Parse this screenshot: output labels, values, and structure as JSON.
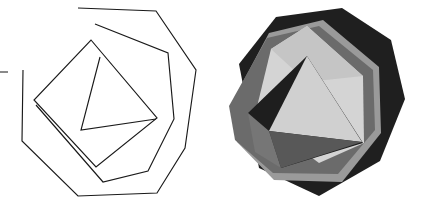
{
  "figure": {
    "canvas": {
      "width": 423,
      "height": 218,
      "background": "#ffffff"
    },
    "panels": [
      {
        "id": "outline",
        "name": "wireframe-polygon-figure",
        "label": "Outline wireframe rendering",
        "origin_x": 0,
        "width": 212
      },
      {
        "id": "shaded",
        "name": "shaded-polygon-figure",
        "label": "Flat-shaded grayscale rendering",
        "origin_x": 211,
        "width": 212
      }
    ],
    "colors": {
      "stroke": "#1a1a1a",
      "background": "#ffffff",
      "ring_outer_dark": "#1f1f1f",
      "ring_mid_gray": "#6b6b6b",
      "ring_light_gray": "#9a9a9a",
      "face_pale": "#d4d4d4",
      "face_bright": "#d0d0d0",
      "face_dark": "#1e1e1e",
      "face_shadow_gray": "#585858",
      "face_mid_shadow": "#767676"
    },
    "outline_shapes": [
      {
        "name": "outer-heptagon",
        "closed": false,
        "points": "78,8 156,11 196,70 185,148 157,193 78,196 22,141 23,70"
      },
      {
        "name": "middle-hexagon",
        "closed": false,
        "points": "95,24 168,53 174,119 148,171 103,182 36,105"
      },
      {
        "name": "inner-diamond",
        "closed": true,
        "points": "91,40 157,118 96,167 34,100"
      },
      {
        "name": "inner-triangle",
        "closed": false,
        "points": "100,57 81,130 156,119"
      },
      {
        "name": "left-edge-tick",
        "closed": false,
        "points": "0,72 8,72"
      }
    ],
    "shaded_faces": [
      {
        "name": "octagon-silhouette",
        "color": "#1f1f1f",
        "points": "28,64 65,17 131,8 180,40 194,99 169,161 108,196 48,168"
      },
      {
        "name": "ring-light-gray-face",
        "color": "#9a9a9a",
        "points": "20,104 58,33 112,20 168,67 170,133 131,182 63,180 26,142"
      },
      {
        "name": "ring-mid-gray-face",
        "color": "#6b6b6b",
        "points": "18,106 56,38 108,26 162,70 164,130 127,174 62,173 24,140"
      },
      {
        "name": "pale-polygon-face",
        "color": "#d4d4d4",
        "points": "60,49 96,26 152,76 153,143 108,163 44,115"
      },
      {
        "name": "pale-polygon-upper",
        "color": "#c5c5c5",
        "points": "60,49 96,26 152,76 96,82"
      },
      {
        "name": "dark-quad-face",
        "color": "#1e1e1e",
        "points": "37,113 96,56 152,143 70,168"
      },
      {
        "name": "bright-triangle-face",
        "color": "#d0d0d0",
        "points": "96,56 151,142 58,131"
      },
      {
        "name": "shadow-wedge-face",
        "color": "#585858",
        "points": "58,131 151,142 70,168"
      },
      {
        "name": "mid-shadow-face",
        "color": "#767676",
        "points": "37,113 58,131 70,168 44,152"
      }
    ]
  }
}
